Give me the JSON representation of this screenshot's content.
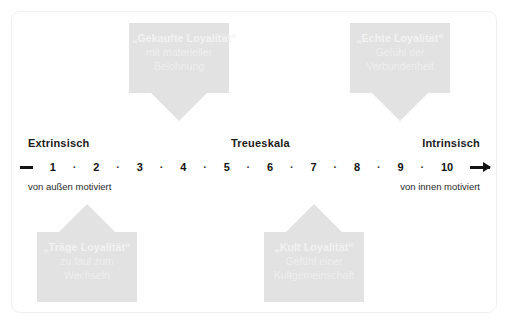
{
  "card": {
    "border_color": "#f0f0f0",
    "background": "#ffffff"
  },
  "theme": {
    "callout_fill": "#e2e2e2",
    "callout_text": "#f2f2f2",
    "axis_color": "#141414"
  },
  "callouts": [
    {
      "id": "gekaufte",
      "direction": "down",
      "title": "„Gekaufte Loyalität“",
      "line1": "mit materieller",
      "line2": "Belohnung"
    },
    {
      "id": "echte",
      "direction": "down",
      "title": "„Echte Loyalität“",
      "line1": "Gefühl der",
      "line2": "Verbundenheit"
    },
    {
      "id": "traege",
      "direction": "up",
      "title": "„Träge Loyalität“",
      "line1": "zu faul zum",
      "line2": "Wechseln"
    },
    {
      "id": "kult",
      "direction": "up",
      "title": "„Kult Loyalität“",
      "line1": "Gefühl einer",
      "line2": "Kultgemeinschaft"
    }
  ],
  "scale": {
    "left_pole": "Extrinsisch",
    "center_label": "Treueskala",
    "right_pole": "Intrinsisch",
    "left_sub": "von außen motiviert",
    "right_sub": "von innen motiviert",
    "start_marker": "minus-dash",
    "end_marker": "right-arrow",
    "ticks": [
      "1",
      "2",
      "3",
      "4",
      "5",
      "6",
      "7",
      "8",
      "9",
      "10"
    ],
    "separator": "·"
  },
  "chart_data": {
    "type": "diagram",
    "title": "Treueskala",
    "axis": {
      "name": "Treueskala",
      "left_end_label": "Extrinsisch",
      "right_end_label": "Intrinsisch",
      "left_end_sublabel": "von außen motiviert",
      "right_end_sublabel": "von innen motiviert",
      "ticks": [
        1,
        2,
        3,
        4,
        5,
        6,
        7,
        8,
        9,
        10
      ],
      "range": [
        1,
        10
      ]
    },
    "annotations": [
      {
        "label": "„Gekaufte Loyalität“",
        "description": "mit materieller Belohnung",
        "points_to": 4,
        "side": "above"
      },
      {
        "label": "„Echte Loyalität“",
        "description": "Gefühl der Verbundenheit",
        "points_to": 9,
        "side": "above"
      },
      {
        "label": "„Träge Loyalität“",
        "description": "zu faul zum Wechseln",
        "points_to": 2,
        "side": "below"
      },
      {
        "label": "„Kult Loyalität“",
        "description": "Gefühl einer Kultgemeinschaft",
        "points_to": 7,
        "side": "below"
      }
    ]
  }
}
